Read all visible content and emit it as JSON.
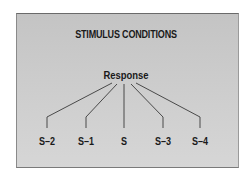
{
  "diagram": {
    "title": "STIMULUS CONDITIONS",
    "root": "Response",
    "leaves": [
      {
        "label": "S–2",
        "x": 47
      },
      {
        "label": "S–1",
        "x": 86
      },
      {
        "label": "S",
        "x": 124
      },
      {
        "label": "S–3",
        "x": 163
      },
      {
        "label": "S–4",
        "x": 200
      }
    ],
    "colors": {
      "panel": "#cbcbcb",
      "text": "#1a1a1a",
      "line": "#3a3a3a"
    }
  }
}
